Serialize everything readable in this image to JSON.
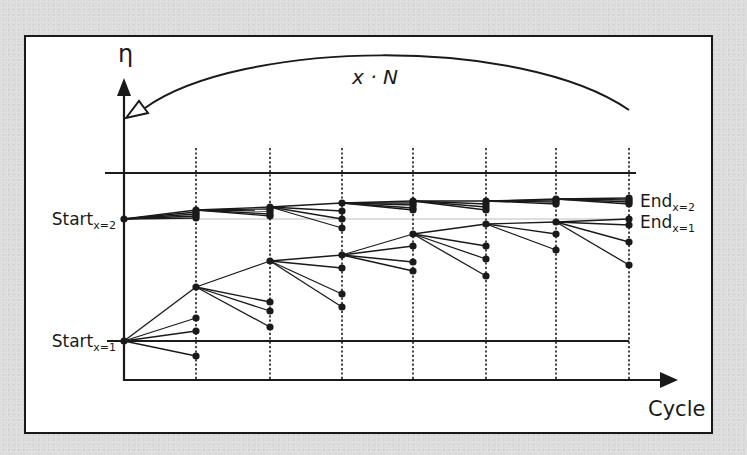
{
  "diagram": {
    "y_axis_label": "η",
    "x_axis_label": "Cycle",
    "loop_label": "x · N",
    "start_labels": [
      {
        "main": "Start",
        "sub": "x=2",
        "y": 219
      },
      {
        "main": "Start",
        "sub": "x=1",
        "y": 341
      }
    ],
    "end_labels": [
      {
        "main": "End",
        "sub": "x=2",
        "y": 201
      },
      {
        "main": "End",
        "sub": "x=1",
        "y": 222
      }
    ],
    "columns": [
      {
        "cycle": "1",
        "line1": "AFR",
        "line2": "λ"
      },
      {
        "cycle": "2",
        "line1": "Intake",
        "line2": "VVT"
      },
      {
        "cycle": "3",
        "line1": "Exhaust",
        "line2": "VVT"
      },
      {
        "cycle": "4",
        "line1": "Waste",
        "line2": "Gate"
      },
      {
        "cycle": "5",
        "line1": "Tumble",
        "line2": "Flap"
      },
      {
        "cycle": "6",
        "line1": "Throttle",
        "line2": "Angle"
      },
      {
        "cycle": "7",
        "line1": "Spark",
        "line2": "Timing"
      }
    ],
    "column_bounds_x": [
      124,
      196,
      270,
      342,
      413,
      486,
      556,
      629
    ],
    "trees": [
      {
        "name": "x=1",
        "start": [
          124,
          341
        ],
        "stages": [
          {
            "best": 287,
            "others": [
              318,
              331,
              356
            ]
          },
          {
            "best": 261,
            "others": [
              302,
              311,
              327
            ]
          },
          {
            "best": 255,
            "others": [
              268,
              294,
              307
            ]
          },
          {
            "best": 234,
            "others": [
              246,
              262,
              271
            ]
          },
          {
            "best": 224,
            "others": [
              246,
              259,
              276
            ]
          },
          {
            "best": 222,
            "others": [
              234,
              250
            ]
          },
          {
            "best": 219,
            "others": [
              225,
              242,
              265
            ]
          }
        ]
      },
      {
        "name": "x=2",
        "start": [
          124,
          219
        ],
        "stages": [
          {
            "best": 210,
            "others": [
              212,
              214,
              216,
              218
            ]
          },
          {
            "best": 207,
            "others": [
              209,
              211,
              214,
              216
            ]
          },
          {
            "best": 203,
            "others": [
              211,
              219,
              228
            ]
          },
          {
            "best": 201,
            "others": [
              203,
              205,
              208,
              210
            ]
          },
          {
            "best": 201,
            "others": [
              204,
              207,
              210
            ]
          },
          {
            "best": 199,
            "others": [
              200,
              202,
              204
            ]
          },
          {
            "best": 198,
            "others": [
              200,
              202,
              204
            ]
          }
        ]
      }
    ],
    "colors": {
      "stroke": "#1a1a1a",
      "background": "#dcdcdc",
      "panel": "#ffffff",
      "reference_line": "#bdbdbd"
    }
  }
}
